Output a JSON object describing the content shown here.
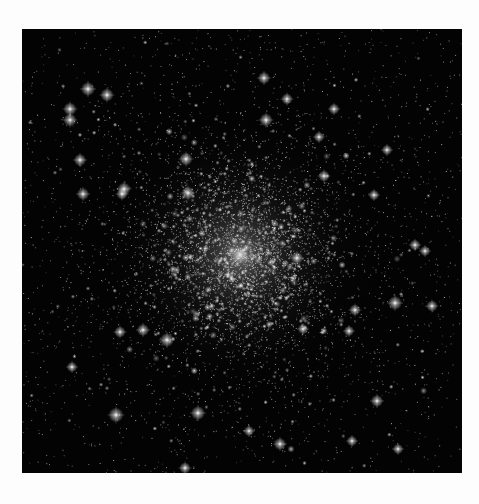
{
  "image": {
    "subject": "globular star cluster",
    "background_color": "#030303",
    "page_background": "#fdfdfd",
    "frame": {
      "x": 22,
      "y": 29,
      "width": 440,
      "height": 444
    },
    "core_center": {
      "x": 218,
      "y": 226
    },
    "core_glow_radius": 150,
    "star_count": 5200,
    "bright_stars": [
      {
        "x": 66,
        "y": 60,
        "r": 3.2
      },
      {
        "x": 85,
        "y": 66,
        "r": 3.0
      },
      {
        "x": 48,
        "y": 80,
        "r": 3.0
      },
      {
        "x": 48,
        "y": 91,
        "r": 3.0
      },
      {
        "x": 58,
        "y": 131,
        "r": 2.8
      },
      {
        "x": 102,
        "y": 160,
        "r": 3.0
      },
      {
        "x": 61,
        "y": 165,
        "r": 2.8
      },
      {
        "x": 100,
        "y": 165,
        "r": 2.6
      },
      {
        "x": 244,
        "y": 91,
        "r": 3.0
      },
      {
        "x": 164,
        "y": 130,
        "r": 3.0
      },
      {
        "x": 166,
        "y": 164,
        "r": 3.0
      },
      {
        "x": 242,
        "y": 49,
        "r": 2.8
      },
      {
        "x": 265,
        "y": 70,
        "r": 2.6
      },
      {
        "x": 312,
        "y": 80,
        "r": 2.5
      },
      {
        "x": 297,
        "y": 108,
        "r": 2.4
      },
      {
        "x": 365,
        "y": 121,
        "r": 2.4
      },
      {
        "x": 302,
        "y": 147,
        "r": 2.6
      },
      {
        "x": 352,
        "y": 166,
        "r": 2.4
      },
      {
        "x": 393,
        "y": 216,
        "r": 2.5
      },
      {
        "x": 403,
        "y": 222,
        "r": 2.4
      },
      {
        "x": 121,
        "y": 301,
        "r": 2.8
      },
      {
        "x": 145,
        "y": 311,
        "r": 3.2
      },
      {
        "x": 98,
        "y": 303,
        "r": 2.6
      },
      {
        "x": 50,
        "y": 338,
        "r": 2.4
      },
      {
        "x": 94,
        "y": 386,
        "r": 3.4
      },
      {
        "x": 176,
        "y": 384,
        "r": 3.2
      },
      {
        "x": 163,
        "y": 439,
        "r": 2.6
      },
      {
        "x": 373,
        "y": 274,
        "r": 3.2
      },
      {
        "x": 333,
        "y": 281,
        "r": 2.6
      },
      {
        "x": 275,
        "y": 229,
        "r": 2.8
      },
      {
        "x": 281,
        "y": 300,
        "r": 2.4
      },
      {
        "x": 355,
        "y": 372,
        "r": 2.8
      },
      {
        "x": 330,
        "y": 412,
        "r": 2.4
      },
      {
        "x": 376,
        "y": 420,
        "r": 2.4
      },
      {
        "x": 327,
        "y": 302,
        "r": 2.4
      },
      {
        "x": 410,
        "y": 277,
        "r": 2.6
      },
      {
        "x": 258,
        "y": 415,
        "r": 2.8
      },
      {
        "x": 227,
        "y": 402,
        "r": 2.4
      }
    ]
  }
}
